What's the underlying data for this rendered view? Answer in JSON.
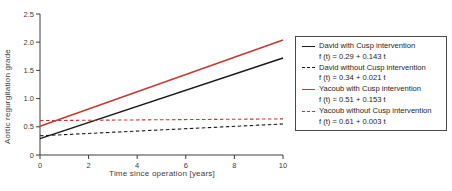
{
  "colors": {
    "axis": "#3d3d3d",
    "david": "#1a1a1a",
    "yacoub": "#c83730",
    "background": "#ffffff",
    "legend_border": "#4a4a4a"
  },
  "chart_data": {
    "type": "line",
    "title": "",
    "xlabel": "Time since operation [years]",
    "ylabel": "Aortic regurgitation grade",
    "xlim": [
      0,
      10
    ],
    "ylim": [
      0,
      2.5
    ],
    "xticks": [
      0,
      2,
      4,
      6,
      8,
      10
    ],
    "xtick_labels": [
      "0",
      "2",
      "4",
      "6",
      "8",
      "10"
    ],
    "yticks": [
      0,
      0.5,
      1.0,
      1.5,
      2.0,
      2.5
    ],
    "ytick_labels": [
      "0",
      "0.5",
      "1.0",
      "1.5",
      "2.0",
      "2.5"
    ],
    "grid": false,
    "legend_position": "right",
    "series": [
      {
        "name": "David with Cusp intervention",
        "formula": "f (t) = 0.29 + 0.143 t",
        "intercept": 0.29,
        "slope": 0.143,
        "x": [
          0,
          10
        ],
        "y": [
          0.29,
          1.72
        ],
        "color": "#1a1a1a",
        "style": "solid"
      },
      {
        "name": "David without Cusp intervention",
        "formula": "f (t) = 0.34 + 0.021 t",
        "intercept": 0.34,
        "slope": 0.021,
        "x": [
          0,
          10
        ],
        "y": [
          0.34,
          0.55
        ],
        "color": "#1a1a1a",
        "style": "dashed"
      },
      {
        "name": "Yacoub with Cusp intervention",
        "formula": "f (t) = 0.51 + 0.153 t",
        "intercept": 0.51,
        "slope": 0.153,
        "x": [
          0,
          10
        ],
        "y": [
          0.51,
          2.04
        ],
        "color": "#c83730",
        "style": "solid"
      },
      {
        "name": "Yacoub without Cusp intervention",
        "formula": "f (t) = 0.61 + 0.003 t",
        "intercept": 0.61,
        "slope": 0.003,
        "x": [
          0,
          10
        ],
        "y": [
          0.61,
          0.64
        ],
        "color": "#c83730",
        "style": "dashed"
      }
    ]
  }
}
